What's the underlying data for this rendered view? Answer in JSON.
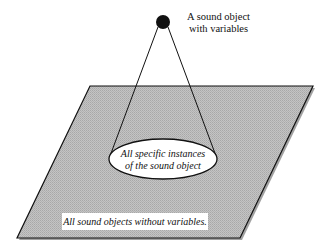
{
  "diagram": {
    "sound_object_label_line1": "A sound object",
    "sound_object_label_line2": "with variables",
    "instances_label_line1": "All specific instances",
    "instances_label_line2": "of the sound object",
    "plane_label": "All sound objects without variables.",
    "colors": {
      "plane_fill": "#bdbdbd",
      "line": "#111111",
      "dot": "#111111",
      "ellipse_fill": "#ffffff"
    }
  }
}
